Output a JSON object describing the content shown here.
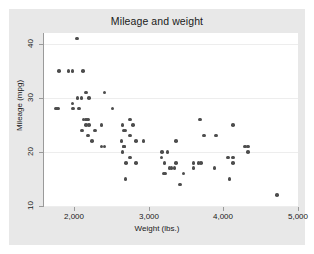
{
  "chart_data": {
    "type": "scatter",
    "title": "Mileage and weight",
    "xlabel": "Weight (lbs.)",
    "ylabel": "Mileage (mpg)",
    "xlim": [
      1600,
      5000
    ],
    "ylim": [
      10,
      42
    ],
    "xticks": [
      2000,
      3000,
      4000,
      5000
    ],
    "xtick_labels": [
      "2,000",
      "3,000",
      "4,000",
      "5,000"
    ],
    "yticks": [
      10,
      20,
      30,
      40
    ],
    "ytick_labels": [
      "10",
      "20",
      "30",
      "40"
    ],
    "grid": "horizontal",
    "legend": "none",
    "marker_color": "#4d4d4d",
    "plot_background": "#ffffff",
    "graph_background": "#e8e8e8",
    "gridline_color": "#ededed",
    "n_points": 74,
    "series": [
      {
        "name": "Mileage vs weight",
        "x": [
          2930,
          3350,
          2640,
          3250,
          4080,
          3670,
          3690,
          3180,
          3220,
          4060,
          3600,
          3740,
          4130,
          4130,
          2690,
          3280,
          3880,
          4330,
          3900,
          4290,
          2110,
          2200,
          2670,
          3700,
          3470,
          3210,
          3200,
          4330,
          3370,
          4720,
          3370,
          4130,
          2830,
          2070,
          2650,
          3600,
          2750,
          2280,
          2750,
          1800,
          1790,
          1760,
          2050,
          2410,
          2520,
          2790,
          2130,
          2190,
          2670,
          2160,
          2370,
          1980,
          2160,
          2040,
          2160,
          2700,
          2120,
          1980,
          2690,
          2100,
          2410,
          2750,
          3170,
          2830,
          2200,
          2670,
          3310,
          2190,
          2240,
          2370,
          2650,
          1930,
          1990,
          3420
        ],
        "y": [
          22,
          17,
          22,
          20,
          15,
          18,
          26,
          20,
          16,
          19,
          17,
          23,
          25,
          18,
          15,
          17,
          17,
          20,
          23,
          21,
          24,
          25,
          21,
          18,
          16,
          18,
          16,
          21,
          18,
          12,
          22,
          19,
          22,
          28,
          20,
          18,
          26,
          24,
          19,
          35,
          28,
          28,
          30,
          31,
          28,
          25,
          26,
          26,
          24,
          26,
          25,
          29,
          31,
          41,
          25,
          18,
          35,
          35,
          24,
          30,
          21,
          23,
          19,
          18,
          30,
          21,
          17,
          23,
          22,
          21,
          25,
          35,
          28,
          14
        ]
      }
    ]
  }
}
